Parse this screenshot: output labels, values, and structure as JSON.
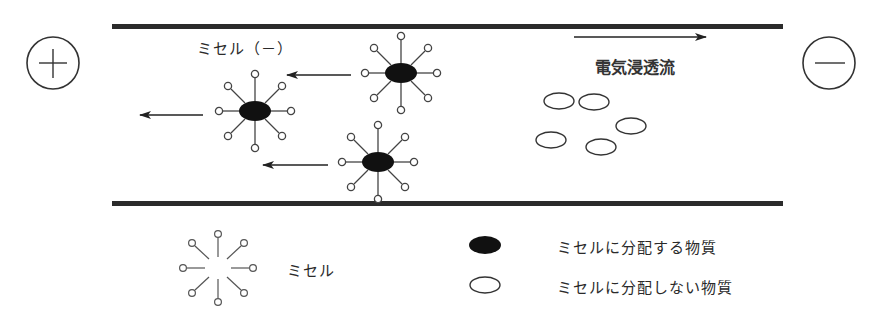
{
  "diagram": {
    "electrodes": {
      "anode": {
        "symbol": "+",
        "name": "plus-electrode"
      },
      "cathode": {
        "symbol": "−",
        "name": "minus-electrode"
      }
    },
    "labels": {
      "micelle_charged": "ミセル（－）",
      "eof": "電気浸透流"
    },
    "legend": [
      {
        "symbol": "micelle-glyph",
        "label": "ミセル"
      },
      {
        "symbol": "filled-ellipse",
        "label": "ミセルに分配する物質"
      },
      {
        "symbol": "open-ellipse",
        "label": "ミセルに分配しない物質"
      }
    ],
    "micelles_in_capillary": 3,
    "free_solutes_in_capillary": 5,
    "arrows": {
      "micelle_direction": "left (toward +)",
      "eof_direction": "right (toward −)"
    },
    "colors": {
      "line": "#2b2b2b",
      "fill": "#111111",
      "background": "#ffffff"
    }
  }
}
